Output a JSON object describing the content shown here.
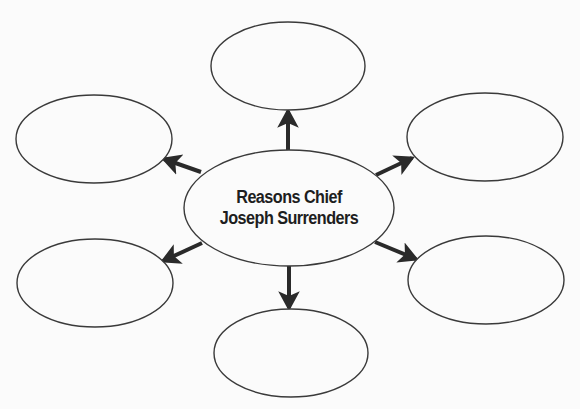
{
  "diagram": {
    "type": "web-organizer",
    "colors": {
      "background": "#fbfbfb",
      "stroke": "#3a3a3a",
      "arrow": "#2a2a2a",
      "text": "#1e1e1e"
    },
    "center": {
      "line1": "Reasons Chief",
      "line2": "Joseph Surrenders",
      "cx": 289,
      "cy": 208,
      "rx": 105,
      "ry": 58
    },
    "nodes": [
      {
        "id": "top",
        "text": "",
        "cx": 288,
        "cy": 66,
        "rx": 77,
        "ry": 44
      },
      {
        "id": "upper-left",
        "text": "",
        "cx": 94,
        "cy": 139,
        "rx": 78,
        "ry": 44
      },
      {
        "id": "upper-right",
        "text": "",
        "cx": 485,
        "cy": 137,
        "rx": 78,
        "ry": 44
      },
      {
        "id": "lower-left",
        "text": "",
        "cx": 95,
        "cy": 283,
        "rx": 78,
        "ry": 44
      },
      {
        "id": "lower-right",
        "text": "",
        "cx": 486,
        "cy": 280,
        "rx": 78,
        "ry": 44
      },
      {
        "id": "bottom",
        "text": "",
        "cx": 291,
        "cy": 353,
        "rx": 77,
        "ry": 44
      }
    ],
    "arrows": [
      {
        "to": "top",
        "x1": 288,
        "y1": 150,
        "x2": 288,
        "y2": 111
      },
      {
        "to": "upper-left",
        "x1": 201,
        "y1": 172,
        "x2": 164,
        "y2": 159
      },
      {
        "to": "upper-right",
        "x1": 376,
        "y1": 175,
        "x2": 412,
        "y2": 158
      },
      {
        "to": "lower-left",
        "x1": 202,
        "y1": 243,
        "x2": 163,
        "y2": 261
      },
      {
        "to": "lower-right",
        "x1": 375,
        "y1": 242,
        "x2": 416,
        "y2": 259
      },
      {
        "to": "bottom",
        "x1": 289,
        "y1": 266,
        "x2": 289,
        "y2": 308
      }
    ]
  }
}
